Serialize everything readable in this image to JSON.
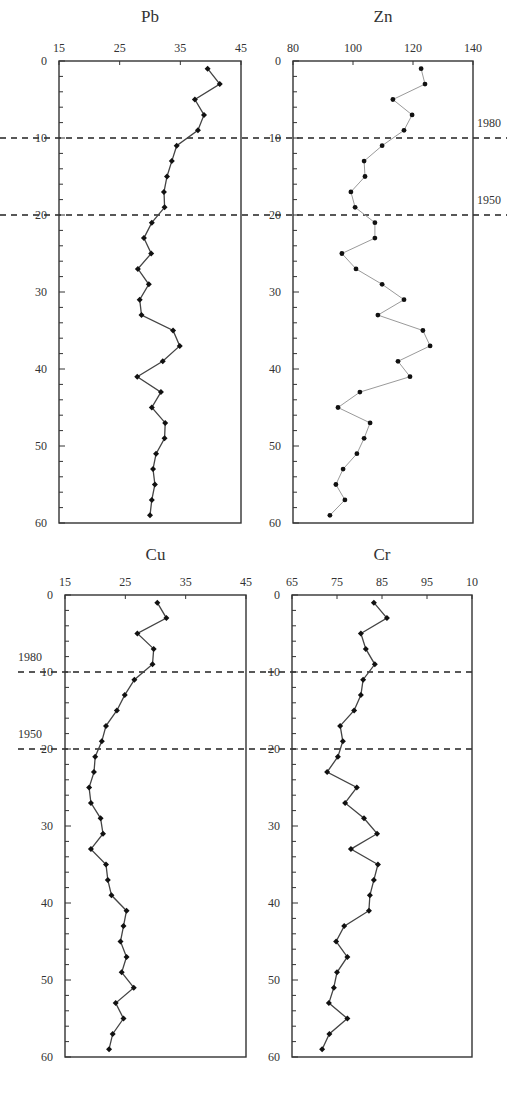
{
  "figure": {
    "depth_axis": {
      "range": [
        0,
        60
      ],
      "ticks": [
        0,
        10,
        20,
        30,
        40,
        50,
        60
      ],
      "minor_step": 2,
      "inverted": true
    },
    "reference_lines": [
      {
        "depth": 10,
        "label": "1980"
      },
      {
        "depth": 20,
        "label": "1950"
      }
    ],
    "line_color": "#444444",
    "zn_line_color": "#9a9a9a",
    "dash_color": "#222222"
  },
  "chart_data": [
    {
      "type": "line",
      "title": "Pb",
      "xlabel": "",
      "ylabel": "",
      "xlim": [
        15,
        45
      ],
      "x_ticks": [
        "15",
        "25",
        "35",
        "45"
      ],
      "ylim": [
        0,
        60
      ],
      "y_ticks": [
        "0",
        "10",
        "20",
        "30",
        "40",
        "50",
        "60"
      ],
      "grid": false,
      "depth": [
        1,
        3,
        5,
        7,
        9,
        11,
        13,
        15,
        17,
        19,
        21,
        23,
        25,
        27,
        29,
        31,
        33,
        35,
        37,
        39,
        41,
        43,
        45,
        47,
        49,
        51,
        53,
        55,
        57,
        59
      ],
      "values": [
        39.5,
        41.5,
        37.4,
        38.9,
        37.9,
        34.4,
        33.6,
        32.8,
        32.3,
        32.4,
        30.3,
        29.0,
        30.2,
        28.0,
        29.8,
        28.3,
        28.6,
        33.8,
        34.9,
        32.1,
        27.9,
        31.8,
        30.3,
        32.5,
        32.4,
        31.0,
        30.5,
        30.8,
        30.3,
        30.0
      ],
      "annotations": []
    },
    {
      "type": "line",
      "title": "Zn",
      "xlabel": "",
      "ylabel": "",
      "xlim": [
        80,
        140
      ],
      "x_ticks": [
        "80",
        "100",
        "120",
        "140"
      ],
      "ylim": [
        0,
        60
      ],
      "y_ticks": [
        "0",
        "10",
        "20",
        "30",
        "40",
        "50",
        "60"
      ],
      "grid": false,
      "depth": [
        1,
        3,
        5,
        7,
        9,
        11,
        13,
        15,
        17,
        19,
        21,
        23,
        25,
        27,
        29,
        31,
        33,
        35,
        37,
        39,
        41,
        43,
        45,
        47,
        49,
        51,
        53,
        55,
        57,
        59
      ],
      "values": [
        122.7,
        124.0,
        113.3,
        119.7,
        117.0,
        109.7,
        103.7,
        104.0,
        99.3,
        100.7,
        107.3,
        107.3,
        96.3,
        101.0,
        109.7,
        117.0,
        108.3,
        123.3,
        125.7,
        115.0,
        119.0,
        102.3,
        95.0,
        105.7,
        103.7,
        101.3,
        96.7,
        94.3,
        97.3,
        92.3
      ],
      "annotations": [
        "1980",
        "1950"
      ]
    },
    {
      "type": "line",
      "title": "Cu",
      "xlabel": "",
      "ylabel": "",
      "xlim": [
        15,
        45
      ],
      "x_ticks": [
        "15",
        "25",
        "35",
        "45"
      ],
      "ylim": [
        0,
        60
      ],
      "y_ticks": [
        "0",
        "10",
        "20",
        "30",
        "40",
        "50",
        "60"
      ],
      "grid": false,
      "depth": [
        1,
        3,
        5,
        7,
        9,
        11,
        13,
        15,
        17,
        19,
        21,
        23,
        25,
        27,
        29,
        31,
        33,
        35,
        37,
        39,
        41,
        43,
        45,
        47,
        49,
        51,
        53,
        55,
        57,
        59
      ],
      "values": [
        30.3,
        31.8,
        27.0,
        29.7,
        29.5,
        26.5,
        24.9,
        23.6,
        21.8,
        21.1,
        20.0,
        19.8,
        19.0,
        19.3,
        20.9,
        21.3,
        19.3,
        21.8,
        22.1,
        22.7,
        25.2,
        24.7,
        24.2,
        25.2,
        24.4,
        26.4,
        23.4,
        24.7,
        22.9,
        22.3
      ],
      "annotations": [
        "1980",
        "1950"
      ]
    },
    {
      "type": "line",
      "title": "Cr",
      "xlabel": "",
      "ylabel": "",
      "xlim": [
        65,
        105
      ],
      "x_ticks": [
        "65",
        "75",
        "85",
        "95",
        "10"
      ],
      "ylim": [
        0,
        60
      ],
      "y_ticks": [
        "0",
        "10",
        "20",
        "30",
        "40",
        "50",
        "60"
      ],
      "grid": false,
      "depth": [
        1,
        3,
        5,
        7,
        9,
        11,
        13,
        15,
        17,
        19,
        21,
        23,
        25,
        27,
        29,
        31,
        33,
        35,
        37,
        39,
        41,
        43,
        45,
        47,
        49,
        51,
        53,
        55,
        57,
        59
      ],
      "values": [
        83.2,
        86.1,
        80.3,
        81.4,
        83.4,
        80.8,
        80.3,
        78.8,
        75.7,
        76.3,
        75.2,
        72.8,
        79.4,
        76.8,
        81.0,
        83.9,
        78.1,
        84.1,
        83.2,
        82.3,
        82.1,
        76.6,
        74.8,
        77.3,
        75.0,
        74.3,
        73.2,
        77.3,
        73.3,
        71.7
      ],
      "annotations": []
    }
  ],
  "panels": [
    {
      "id": "pb",
      "left": 59,
      "right": 241,
      "top": 61,
      "bottom": 523,
      "title_y": 22,
      "line_key": "line_color",
      "year_labels": "none"
    },
    {
      "id": "zn",
      "left": 293,
      "right": 473,
      "top": 61,
      "bottom": 523,
      "title_y": 22,
      "line_key": "zn_line_color",
      "year_labels": "right"
    },
    {
      "id": "cu",
      "left": 65,
      "right": 246,
      "top": 595,
      "bottom": 1057,
      "title_y": 560,
      "line_key": "line_color",
      "year_labels": "left"
    },
    {
      "id": "cr",
      "left": 292,
      "right": 472,
      "top": 595,
      "bottom": 1057,
      "title_y": 560,
      "line_key": "line_color",
      "year_labels": "none"
    }
  ]
}
